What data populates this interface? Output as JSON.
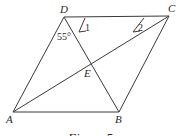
{
  "figure": {
    "caption": "Figure 5",
    "shape": "parallelogram ABCD with diagonals AC and BD intersecting at E",
    "vertices": {
      "A": "A",
      "B": "B",
      "C": "C",
      "D": "D",
      "E": "E"
    },
    "segments": [
      "AB",
      "BC",
      "CD",
      "DA",
      "AC",
      "BD"
    ],
    "angles": {
      "angle_ADB": "55°",
      "angle_1": "1",
      "angle_2": "2"
    }
  }
}
